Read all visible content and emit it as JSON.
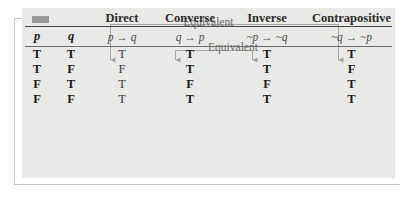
{
  "figure": {
    "corner_marker": "gray-block-marker",
    "panel_background": "#e9e9e7"
  },
  "annotations": {
    "outer": {
      "label": "Equivalent",
      "from_column": "Direct",
      "to_column": "Contrapositive"
    },
    "inner": {
      "label": "Equivalent",
      "from_column": "Converse",
      "to_column": "Inverse"
    }
  },
  "table": {
    "headers": [
      "",
      "",
      "Direct",
      "Converse",
      "Inverse",
      "Contrapositive"
    ],
    "formulas": [
      "p",
      "q",
      "p → q",
      "q → p",
      "~p → ~q",
      "~q → ~p"
    ],
    "rows": [
      [
        "T",
        "T",
        "T",
        "T",
        "T",
        "T"
      ],
      [
        "T",
        "F",
        "F",
        "T",
        "T",
        "F"
      ],
      [
        "F",
        "T",
        "T",
        "F",
        "F",
        "T"
      ],
      [
        "F",
        "F",
        "T",
        "T",
        "T",
        "T"
      ]
    ]
  }
}
